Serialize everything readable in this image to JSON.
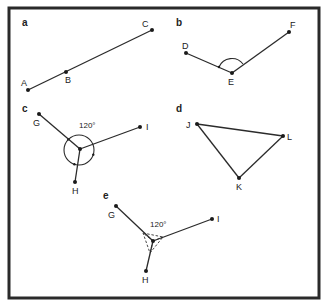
{
  "figure": {
    "frame": {
      "x": 9,
      "y": 8,
      "w": 310,
      "h": 290
    },
    "panels": [
      {
        "id": "a",
        "label": "a",
        "label_pos": [
          22,
          26
        ],
        "points": [
          {
            "name": "A",
            "x": 28,
            "y": 90,
            "lx": 21,
            "ly": 86
          },
          {
            "name": "B",
            "x": 66,
            "y": 72,
            "lx": 65,
            "ly": 83
          },
          {
            "name": "C",
            "x": 152,
            "y": 30,
            "lx": 142,
            "ly": 27
          }
        ],
        "segments": [
          [
            "A",
            "C"
          ]
        ]
      },
      {
        "id": "b",
        "label": "b",
        "label_pos": [
          176,
          26
        ],
        "points": [
          {
            "name": "D",
            "x": 186,
            "y": 53,
            "lx": 182,
            "ly": 49
          },
          {
            "name": "E",
            "x": 232,
            "y": 73,
            "lx": 228,
            "ly": 85
          },
          {
            "name": "F",
            "x": 289,
            "y": 32,
            "lx": 290,
            "ly": 28
          }
        ],
        "segments": [
          [
            "D",
            "E"
          ],
          [
            "E",
            "F"
          ]
        ],
        "angle_arc": {
          "vertex": "E",
          "note": "arc marking angle DEF with arrowhead"
        }
      },
      {
        "id": "c",
        "label": "c",
        "label_pos": [
          22,
          112
        ],
        "angle_label": "120°",
        "angle_label_pos": [
          79,
          128
        ],
        "points": [
          {
            "name": "G",
            "x": 39,
            "y": 114,
            "lx": 33,
            "ly": 126
          },
          {
            "name": "H",
            "x": 75,
            "y": 182,
            "lx": 72,
            "ly": 194
          },
          {
            "name": "I",
            "x": 140,
            "y": 127,
            "lx": 146,
            "ly": 130
          },
          {
            "name": "center",
            "x": 80,
            "y": 149
          }
        ],
        "segments": [
          [
            "G",
            "center"
          ],
          [
            "H",
            "center"
          ],
          [
            "I",
            "center"
          ]
        ],
        "circle": {
          "cx": 79,
          "cy": 150,
          "r": 15
        }
      },
      {
        "id": "d",
        "label": "d",
        "label_pos": [
          176,
          112
        ],
        "points": [
          {
            "name": "J",
            "x": 197,
            "y": 124,
            "lx": 186,
            "ly": 128
          },
          {
            "name": "L",
            "x": 283,
            "y": 136,
            "lx": 287,
            "ly": 140
          },
          {
            "name": "K",
            "x": 239,
            "y": 178,
            "lx": 236,
            "ly": 190
          }
        ],
        "segments": [
          [
            "J",
            "L"
          ],
          [
            "L",
            "K"
          ],
          [
            "K",
            "J"
          ]
        ]
      },
      {
        "id": "e",
        "label": "e",
        "label_pos": [
          103,
          199
        ],
        "angle_label": "120°",
        "angle_label_pos": [
          150,
          227
        ],
        "points": [
          {
            "name": "G",
            "x": 116,
            "y": 206,
            "lx": 108,
            "ly": 218
          },
          {
            "name": "H",
            "x": 146,
            "y": 271,
            "lx": 142,
            "ly": 283
          },
          {
            "name": "I",
            "x": 212,
            "y": 219,
            "lx": 217,
            "ly": 222
          },
          {
            "name": "center",
            "x": 153,
            "y": 241
          }
        ],
        "segments": [
          [
            "G",
            "center"
          ],
          [
            "H",
            "center"
          ],
          [
            "I",
            "center"
          ]
        ],
        "dashed_triangle": [
          [
            143,
            233
          ],
          [
            163,
            237
          ],
          [
            150,
            253
          ]
        ]
      }
    ]
  }
}
